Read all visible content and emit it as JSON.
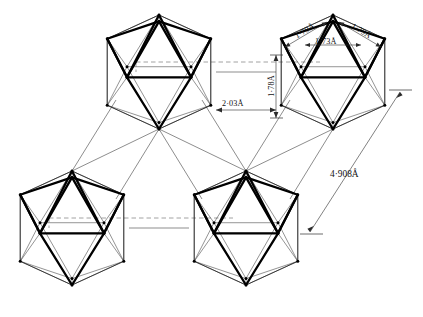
{
  "figure": {
    "background_color": "#ffffff",
    "line_color": "#000000",
    "faint_line_color": "#3f3f3f",
    "dashed_line_color": "#8a8a8a"
  },
  "labels": {
    "bond_top_left": "1·79Å",
    "bond_top_center": "1·73Å",
    "bond_top_right": "1·79Å",
    "bond_vertical": "1·78Å",
    "bond_inter": "2·03Å",
    "cell_diagonal": "4·908Å"
  },
  "clusters": [
    {
      "name": "icosahedron-top-left",
      "cx": 159,
      "cy": 72,
      "r": 57
    },
    {
      "name": "icosahedron-top-right",
      "cx": 333,
      "cy": 72,
      "r": 57
    },
    {
      "name": "icosahedron-bottom-left",
      "cx": 72,
      "cy": 228,
      "r": 57
    },
    {
      "name": "icosahedron-bottom-right",
      "cx": 246,
      "cy": 228,
      "r": 57
    }
  ],
  "dimensions": {
    "inter_icosahedral": "2·03Å",
    "intra_apex_ring": "1·79Å",
    "intra_ring_ring": "1·73Å",
    "intra_vertical": "1·78Å",
    "unit_cell": "4·908Å"
  }
}
